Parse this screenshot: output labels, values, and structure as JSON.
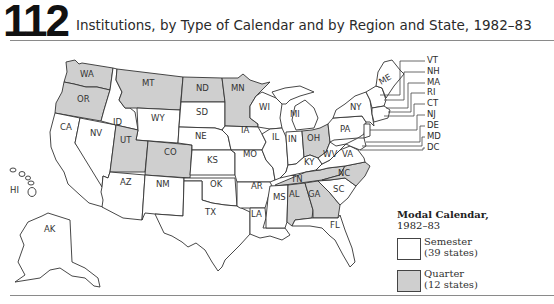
{
  "header": {
    "figure_number": "112",
    "title": "Institutions, by Type of Calendar and by Region and State, 1982–83"
  },
  "legend": {
    "title": "Modal Calendar,",
    "subtitle": "1982–83",
    "items": [
      {
        "label": "Semester",
        "count": "(39 states)",
        "color": "#ffffff"
      },
      {
        "label": "Quarter",
        "count": "(12 states)",
        "color": "#cfcfcf"
      }
    ]
  },
  "colors": {
    "semester": "#ffffff",
    "quarter": "#cfcfcf",
    "border": "#333333"
  },
  "states": {
    "WA": {
      "label": "WA",
      "calendar": "Quarter"
    },
    "OR": {
      "label": "OR",
      "calendar": "Quarter"
    },
    "CA": {
      "label": "CA",
      "calendar": "Semester"
    },
    "ID": {
      "label": "ID",
      "calendar": "Semester"
    },
    "NV": {
      "label": "NV",
      "calendar": "Semester"
    },
    "MT": {
      "label": "MT",
      "calendar": "Quarter"
    },
    "WY": {
      "label": "WY",
      "calendar": "Semester"
    },
    "UT": {
      "label": "UT",
      "calendar": "Quarter"
    },
    "CO": {
      "label": "CO",
      "calendar": "Quarter"
    },
    "AZ": {
      "label": "AZ",
      "calendar": "Semester"
    },
    "NM": {
      "label": "NM",
      "calendar": "Semester"
    },
    "ND": {
      "label": "ND",
      "calendar": "Quarter"
    },
    "SD": {
      "label": "SD",
      "calendar": "Semester"
    },
    "NE": {
      "label": "NE",
      "calendar": "Semester"
    },
    "KS": {
      "label": "KS",
      "calendar": "Semester"
    },
    "OK": {
      "label": "OK",
      "calendar": "Semester"
    },
    "TX": {
      "label": "TX",
      "calendar": "Semester"
    },
    "MN": {
      "label": "MN",
      "calendar": "Quarter"
    },
    "IA": {
      "label": "IA",
      "calendar": "Semester"
    },
    "MO": {
      "label": "MO",
      "calendar": "Semester"
    },
    "AR": {
      "label": "AR",
      "calendar": "Semester"
    },
    "LA": {
      "label": "LA",
      "calendar": "Semester"
    },
    "WI": {
      "label": "WI",
      "calendar": "Semester"
    },
    "IL": {
      "label": "IL",
      "calendar": "Semester"
    },
    "MI": {
      "label": "MI",
      "calendar": "Semester"
    },
    "IN": {
      "label": "IN",
      "calendar": "Semester"
    },
    "OH": {
      "label": "OH",
      "calendar": "Quarter"
    },
    "KY": {
      "label": "KY",
      "calendar": "Semester"
    },
    "TN": {
      "label": "TN",
      "calendar": "Quarter"
    },
    "MS": {
      "label": "MS",
      "calendar": "Semester"
    },
    "AL": {
      "label": "AL",
      "calendar": "Quarter"
    },
    "GA": {
      "label": "GA",
      "calendar": "Quarter"
    },
    "FL": {
      "label": "FL",
      "calendar": "Semester"
    },
    "SC": {
      "label": "SC",
      "calendar": "Semester"
    },
    "NC": {
      "label": "NC",
      "calendar": "Quarter"
    },
    "VA": {
      "label": "VA",
      "calendar": "Semester"
    },
    "WV": {
      "label": "WV",
      "calendar": "Semester"
    },
    "PA": {
      "label": "PA",
      "calendar": "Semester"
    },
    "NY": {
      "label": "NY",
      "calendar": "Semester"
    },
    "ME": {
      "label": "ME",
      "calendar": "Semester"
    },
    "AK": {
      "label": "AK",
      "calendar": "Semester"
    },
    "HI": {
      "label": "HI",
      "calendar": "Semester"
    }
  },
  "northeast_callouts": [
    "VT",
    "NH",
    "MA",
    "RI",
    "CT",
    "NJ",
    "DE",
    "MD",
    "DC"
  ]
}
